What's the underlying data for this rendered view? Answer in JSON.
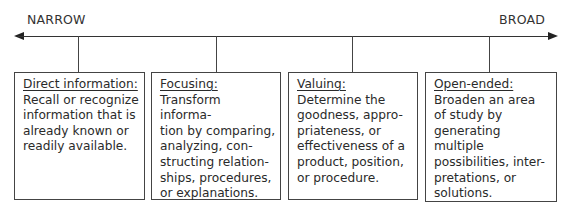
{
  "axis": {
    "left_label": "NARROW",
    "right_label": "BROAD"
  },
  "boxes": [
    {
      "title": "Direct information:",
      "body": "Recall or recognize\ninformation that is\nalready known or\nreadily available."
    },
    {
      "title": "Focusing:",
      "body": "Transform informa-\ntion by comparing,\nanalyzing, con-\nstructing relation-\nships, procedures,\nor explanations."
    },
    {
      "title": "Valuing:",
      "body": "Determine the\ngoodness, appro-\npriateness, or\neffectiveness of a\nproduct, position,\nor procedure."
    },
    {
      "title": "Open-ended:",
      "body": "Broaden an area\nof study by\ngenerating\nmultiple\npossibilities, inter-\npretations, or\nsolutions."
    }
  ]
}
